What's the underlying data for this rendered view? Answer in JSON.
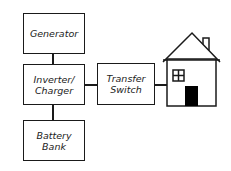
{
  "diagram": {
    "title": "",
    "nodes": [
      {
        "id": "generator",
        "label": "Generator"
      },
      {
        "id": "inverter",
        "label_line1": "Inverter/",
        "label_line2": "Charger"
      },
      {
        "id": "battery",
        "label_line1": "Battery",
        "label_line2": "Bank"
      },
      {
        "id": "transfer",
        "label_line1": "Transfer",
        "label_line2": "Switch"
      },
      {
        "id": "house",
        "label": "house-icon"
      }
    ],
    "edges": [
      {
        "from": "generator",
        "to": "inverter"
      },
      {
        "from": "inverter",
        "to": "battery"
      },
      {
        "from": "inverter",
        "to": "transfer"
      },
      {
        "from": "transfer",
        "to": "house"
      }
    ],
    "colors": {
      "stroke": "#1a1a1a",
      "door": "#000000",
      "background": "#ffffff"
    }
  }
}
